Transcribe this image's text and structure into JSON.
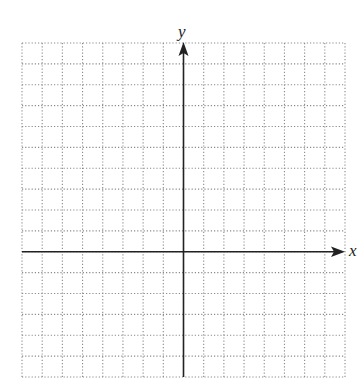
{
  "diagram": {
    "type": "coordinate-plane",
    "grid": {
      "columns": 16,
      "rows": 16,
      "columns_left_of_y_axis": 8,
      "columns_right_of_y_axis": 8,
      "rows_above_x_axis": 10,
      "rows_below_x_axis": 6,
      "line_style": "dotted",
      "line_color": "#8a8a8a"
    },
    "axes": {
      "x_label": "x",
      "y_label": "y",
      "color": "#222222",
      "x_arrow": "right",
      "y_arrow": "up"
    }
  }
}
